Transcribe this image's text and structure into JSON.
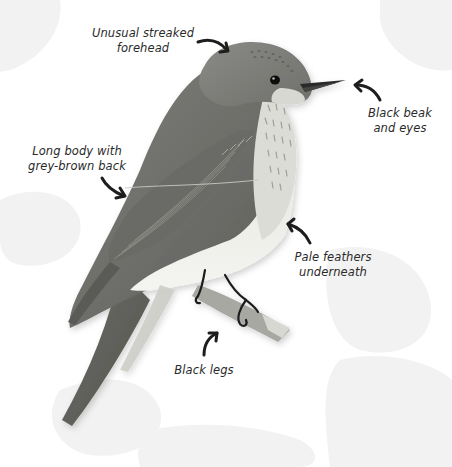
{
  "diagram": {
    "background_color": "#ffffff",
    "leaf_color": "#f1f1f1",
    "arrow_color": "#1e1e1e",
    "text_color": "#2a2a2a",
    "callouts": [
      {
        "id": "forehead",
        "lines": [
          "Unusual streaked",
          "forehead"
        ],
        "arrow_direction": "right-down",
        "points_to": "forehead"
      },
      {
        "id": "beak",
        "lines": [
          "Black beak",
          "and eyes"
        ],
        "arrow_direction": "left-up",
        "points_to": "beak"
      },
      {
        "id": "body",
        "lines": [
          "Long body with",
          "grey-brown back"
        ],
        "arrow_direction": "right-down",
        "points_to": "back"
      },
      {
        "id": "pale",
        "lines": [
          "Pale feathers",
          "underneath"
        ],
        "arrow_direction": "left-up",
        "points_to": "belly"
      },
      {
        "id": "legs",
        "lines": [
          "Black legs"
        ],
        "arrow_direction": "up-right",
        "points_to": "legs"
      }
    ]
  }
}
